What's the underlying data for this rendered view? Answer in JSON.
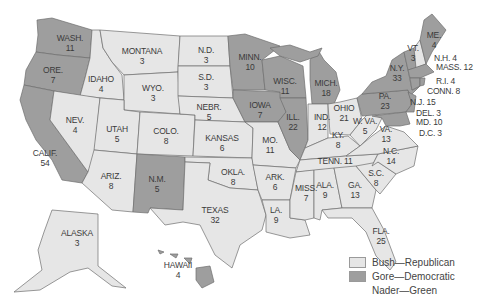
{
  "colors": {
    "bush": "#e6e6e6",
    "gore": "#9e9e9e",
    "border": "#6f6f6f",
    "text": "#3a3a3a"
  },
  "legend": [
    {
      "label": "Bush—Republican",
      "color": "#e6e6e6"
    },
    {
      "label": "Gore—Democratic",
      "color": "#9e9e9e"
    },
    {
      "label": "Nader—Green",
      "color": "none"
    }
  ],
  "states": [
    {
      "abbr": "WASH.",
      "votes": "11",
      "winner": "Gore"
    },
    {
      "abbr": "ORE.",
      "votes": "7",
      "winner": "Gore"
    },
    {
      "abbr": "CALIF.",
      "votes": "54",
      "winner": "Gore"
    },
    {
      "abbr": "IDAHO",
      "votes": "4",
      "winner": "Bush"
    },
    {
      "abbr": "NEV.",
      "votes": "4",
      "winner": "Bush"
    },
    {
      "abbr": "MONTANA",
      "votes": "3",
      "winner": "Bush"
    },
    {
      "abbr": "WYO.",
      "votes": "3",
      "winner": "Bush"
    },
    {
      "abbr": "UTAH",
      "votes": "5",
      "winner": "Bush"
    },
    {
      "abbr": "COLO.",
      "votes": "8",
      "winner": "Bush"
    },
    {
      "abbr": "ARIZ.",
      "votes": "8",
      "winner": "Bush"
    },
    {
      "abbr": "N.M.",
      "votes": "5",
      "winner": "Gore"
    },
    {
      "abbr": "N.D.",
      "votes": "3",
      "winner": "Bush"
    },
    {
      "abbr": "S.D.",
      "votes": "3",
      "winner": "Bush"
    },
    {
      "abbr": "NEBR.",
      "votes": "5",
      "winner": "Bush"
    },
    {
      "abbr": "KANSAS",
      "votes": "6",
      "winner": "Bush"
    },
    {
      "abbr": "OKLA.",
      "votes": "8",
      "winner": "Bush"
    },
    {
      "abbr": "TEXAS",
      "votes": "32",
      "winner": "Bush"
    },
    {
      "abbr": "MINN.",
      "votes": "10",
      "winner": "Gore"
    },
    {
      "abbr": "IOWA",
      "votes": "7",
      "winner": "Gore"
    },
    {
      "abbr": "MO.",
      "votes": "11",
      "winner": "Bush"
    },
    {
      "abbr": "ARK.",
      "votes": "6",
      "winner": "Bush"
    },
    {
      "abbr": "LA.",
      "votes": "9",
      "winner": "Bush"
    },
    {
      "abbr": "WISC.",
      "votes": "11",
      "winner": "Gore"
    },
    {
      "abbr": "ILL.",
      "votes": "22",
      "winner": "Gore"
    },
    {
      "abbr": "MICH.",
      "votes": "18",
      "winner": "Gore"
    },
    {
      "abbr": "IND.",
      "votes": "12",
      "winner": "Bush"
    },
    {
      "abbr": "OHIO",
      "votes": "21",
      "winner": "Bush"
    },
    {
      "abbr": "KY.",
      "votes": "8",
      "winner": "Bush"
    },
    {
      "abbr": "TENN.",
      "votes": "11",
      "winner": "Bush"
    },
    {
      "abbr": "MISS.",
      "votes": "7",
      "winner": "Bush"
    },
    {
      "abbr": "ALA.",
      "votes": "9",
      "winner": "Bush"
    },
    {
      "abbr": "GA.",
      "votes": "13",
      "winner": "Bush"
    },
    {
      "abbr": "FLA.",
      "votes": "25",
      "winner": "Bush"
    },
    {
      "abbr": "S.C.",
      "votes": "8",
      "winner": "Bush"
    },
    {
      "abbr": "N.C.",
      "votes": "14",
      "winner": "Bush"
    },
    {
      "abbr": "VA.",
      "votes": "13",
      "winner": "Bush"
    },
    {
      "abbr": "W. VA.",
      "votes": "5",
      "winner": "Bush"
    },
    {
      "abbr": "PA.",
      "votes": "23",
      "winner": "Gore"
    },
    {
      "abbr": "N.Y.",
      "votes": "33",
      "winner": "Gore"
    },
    {
      "abbr": "VT.",
      "votes": "3",
      "winner": "Gore"
    },
    {
      "abbr": "ME.",
      "votes": "4",
      "winner": "Gore"
    },
    {
      "abbr": "N.H.",
      "votes": "4",
      "winner": "Bush"
    },
    {
      "abbr": "MASS.",
      "votes": "12",
      "winner": "Gore"
    },
    {
      "abbr": "R.I.",
      "votes": "4",
      "winner": "Gore"
    },
    {
      "abbr": "CONN.",
      "votes": "8",
      "winner": "Gore"
    },
    {
      "abbr": "N.J.",
      "votes": "15",
      "winner": "Gore"
    },
    {
      "abbr": "DEL.",
      "votes": "3",
      "winner": "Gore"
    },
    {
      "abbr": "MD.",
      "votes": "10",
      "winner": "Gore"
    },
    {
      "abbr": "D.C.",
      "votes": "3",
      "winner": "Gore"
    },
    {
      "abbr": "ALASKA",
      "votes": "3",
      "winner": "Bush"
    },
    {
      "abbr": "HAWAII",
      "votes": "4",
      "winner": "Gore"
    }
  ],
  "labels": {
    "wash": "WASH.\n11",
    "ore": "ORE.\n7",
    "calif": "CALIF.\n54",
    "idaho": "IDAHO\n4",
    "nev": "NEV.\n4",
    "montana": "MONTANA\n3",
    "wyo": "WYO.\n3",
    "utah": "UTAH\n5",
    "colo": "COLO.\n8",
    "ariz": "ARIZ.\n8",
    "nm": "N.M.\n5",
    "nd": "N.D.\n3",
    "sd": "S.D.\n3",
    "nebr": "NEBR.\n5",
    "kansas": "KANSAS\n6",
    "okla": "OKLA.\n8",
    "texas": "TEXAS\n32",
    "minn": "MINN.\n10",
    "iowa": "IOWA\n7",
    "mo": "MO.\n11",
    "ark": "ARK.\n6",
    "la": "LA.\n9",
    "wisc": "WISC.\n11",
    "ill": "ILL.\n22",
    "mich": "MICH.\n18",
    "ind": "IND.\n12",
    "ohio": "OHIO\n21",
    "ky": "KY.\n8",
    "tenn": "TENN. 11",
    "miss": "MISS.\n7",
    "ala": "ALA.\n9",
    "ga": "GA.\n13",
    "fla": "FLA.\n25",
    "sc": "S.C.\n8",
    "nc": "N.C.\n14",
    "va": "VA.\n13",
    "wva": "W. VA.\n5",
    "pa": "PA.\n23",
    "ny": "N.Y.\n33",
    "vt": "VT.\n3",
    "me": "ME.\n4",
    "nh": "N.H. 4",
    "mass": "MASS. 12",
    "ri": "R.I. 4",
    "conn": "CONN. 8",
    "nj": "N.J. 15",
    "del": "DEL. 3",
    "md": "MD. 10",
    "dc": "D.C. 3",
    "alaska": "ALASKA\n3",
    "hawaii": "HAWAII\n4"
  }
}
